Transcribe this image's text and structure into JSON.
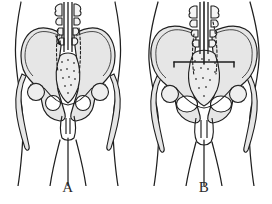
{
  "figure": {
    "background_color": "#ffffff",
    "ink_color": "#1f1f1f",
    "bone_fill_color": "#e6e6e6",
    "bone_fill_color_dark": "#d2d2d2",
    "stipple_color": "#4a4a4a",
    "panel_count": 2
  },
  "panels": [
    {
      "id": "a",
      "label": "A",
      "caption_letter": "A",
      "subject": "male-pelvis",
      "torso_outline": "narrow-hips",
      "features": {
        "lumbar_spine": "vertebral-column-with-spinous-processes",
        "sacrum": "narrow-stippled-sacrum",
        "iliac_wings": "tall-narrow-iliac-wings",
        "obturator_foramen": "small-round-obturator-foramen",
        "pelvic_inlet": "heart-shaped-inlet",
        "femoral_head": "femoral-head-and-greater-trochanter",
        "pubic_symphysis": "narrow-subpubic-arch",
        "needle_markers": "dashed-needle-tracks"
      }
    },
    {
      "id": "b",
      "label": "B",
      "caption_letter": "B",
      "subject": "female-pelvis",
      "torso_outline": "wide-hips",
      "features": {
        "lumbar_spine": "vertebral-column-with-spinous-processes",
        "sacrum": "broad-stippled-sacrum",
        "iliac_wings": "wide-flared-iliac-wings",
        "obturator_foramen": "large-oval-obturator-foramen",
        "pelvic_inlet": "oval-wide-inlet",
        "femoral_head": "femoral-head-and-greater-trochanter",
        "pubic_symphysis": "wide-subpubic-arch",
        "transverse_line": "horizontal-pelvic-brim-line",
        "needle_markers": "dashed-needle-tracks"
      }
    }
  ]
}
